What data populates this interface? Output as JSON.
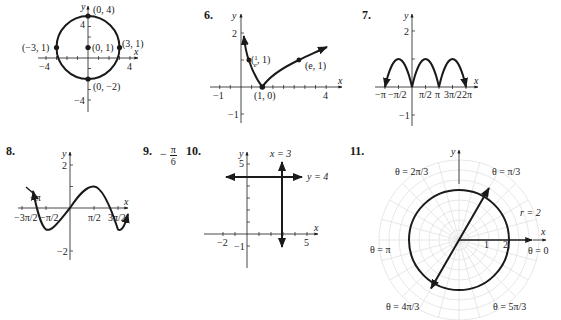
{
  "problems": [
    {
      "number": "6.",
      "label": "6."
    },
    {
      "number": "7.",
      "label": "7."
    },
    {
      "number": "8.",
      "label": "8."
    },
    {
      "number": "9.",
      "label": "9."
    },
    {
      "number": "10.",
      "label": "10."
    },
    {
      "number": "11.",
      "label": "11."
    }
  ],
  "fig5": {
    "axis_x": "x",
    "axis_y": "y",
    "ticks_x": [
      "−4",
      "4"
    ],
    "ticks_y": [
      "4",
      "−4"
    ],
    "points": [
      "(0, 4)",
      "(−3, 1)",
      "(0, 1)",
      "(3, 1)",
      "(0, −2)"
    ]
  },
  "fig6": {
    "axis_x": "x",
    "axis_y": "y",
    "ticks_x": [
      "−1",
      "4"
    ],
    "ticks_y": [
      "2",
      "−1"
    ],
    "points": [
      "(1/e, 1)",
      "(e, 1)",
      "(1, 0)"
    ],
    "p1_num": "1",
    "p1_den": "e"
  },
  "fig7": {
    "axis_x": "x",
    "axis_y": "y",
    "ticks_x": [
      "−π",
      "−π/2",
      "π/2",
      "π",
      "3π/2",
      "2π"
    ],
    "ticks_y": [
      "2",
      "−1"
    ]
  },
  "fig8": {
    "axis_x": "x",
    "axis_y": "y",
    "ticks_x": [
      "−3π/2",
      "−π",
      "−π/2",
      "π/2",
      "3π/2"
    ],
    "ticks_y": [
      "2",
      "−2"
    ]
  },
  "answer9": {
    "sign": "−",
    "num": "π",
    "den": "6"
  },
  "fig10": {
    "axis_x": "x",
    "axis_y": "y",
    "ticks_x": [
      "−2",
      "5"
    ],
    "ticks_y": [
      "5",
      "−1"
    ],
    "line_v": "x = 3",
    "line_h": "y = 4"
  },
  "fig11": {
    "axis_x": "x",
    "axis_y": "y",
    "ticks_r": [
      "1",
      "2"
    ],
    "circle_label": "r = 2",
    "angles": [
      "θ = 2π/3",
      "θ = π/3",
      "θ = π",
      "θ = 0",
      "θ = 4π/3",
      "θ = 5π/3"
    ]
  },
  "colors": {
    "ink": "#1a1a1a",
    "grid": "#d9d9d9"
  }
}
